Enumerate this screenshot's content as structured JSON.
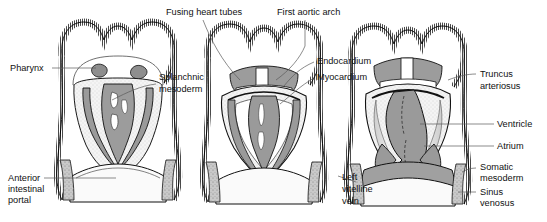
{
  "figure": {
    "panels": [
      {
        "id": "panel-1",
        "stage": "Early — paired endocardial tubes approaching midline"
      },
      {
        "id": "panel-2",
        "stage": "Middle — heart tubes fusing in midline"
      },
      {
        "id": "panel-3",
        "stage": "Late — single heart tube with regional divisions"
      }
    ],
    "colors": {
      "outline": "#000000",
      "mesoderm_gray": "#9a9a9a",
      "light_gray": "#d8d8d8",
      "pale_fill": "#f2f2f2",
      "background": "#ffffff",
      "leader_line": "#5a5a5a",
      "text": "#111111"
    }
  },
  "labels": {
    "pharynx": "Pharynx",
    "splanchnic_mesoderm_line1": "Splanchnic",
    "splanchnic_mesoderm_line2": "mesoderm",
    "anterior_intestinal_portal_line1": "Anterior",
    "anterior_intestinal_portal_line2": "intestinal",
    "anterior_intestinal_portal_line3": "portal",
    "fusing_heart_tubes": "Fusing heart tubes",
    "first_aortic_arch": "First aortic arch",
    "endocardium": "Endocardium",
    "myocardium": "Myocardium",
    "left_vitelline_vein_line1": "Left",
    "left_vitelline_vein_line2": "vitelline",
    "left_vitelline_vein_line3": "vein",
    "truncus_arteriosus_line1": "Truncus",
    "truncus_arteriosus_line2": "arteriosus",
    "ventricle": "Ventricle",
    "atrium": "Atrium",
    "somatic_mesoderm_line1": "Somatic",
    "somatic_mesoderm_line2": "mesoderm",
    "sinus_venosus_line1": "Sinus",
    "sinus_venosus_line2": "venosus"
  }
}
